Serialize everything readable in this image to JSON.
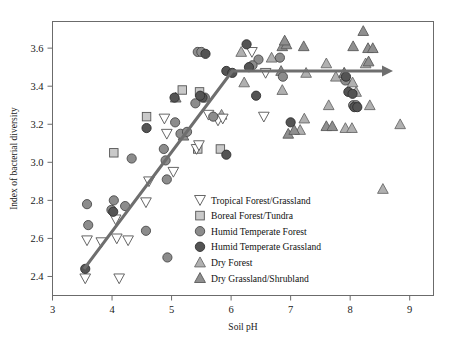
{
  "chart_data": {
    "type": "scatter",
    "title": "",
    "xlabel": "Soil pH",
    "ylabel": "Index of bacterial diversity",
    "xlim": [
      3,
      9.4
    ],
    "ylim": [
      2.3,
      3.74
    ],
    "xticks": [
      3,
      4,
      5,
      6,
      7,
      8,
      9
    ],
    "yticks": [
      2.4,
      2.6,
      2.8,
      3.0,
      3.2,
      3.4,
      3.6
    ],
    "xtick_labels": [
      "3",
      "4",
      "5",
      "6",
      "7",
      "8",
      "9"
    ],
    "ytick_labels": [
      "2.4",
      "2.6",
      "2.8",
      "3.0",
      "3.2",
      "3.4",
      "3.6"
    ],
    "grid": false,
    "legend_position": "center",
    "annotations": [
      {
        "name": "trend-arrow",
        "type": "arrow-polyline",
        "points": [
          [
            3.53,
            2.44
          ],
          [
            6.02,
            3.48
          ],
          [
            8.72,
            3.48
          ]
        ],
        "color": "#6e6e6e"
      }
    ],
    "series": [
      {
        "name": "Tropical Forest/Grassland",
        "marker": "triangle-down",
        "fill": "#ffffff",
        "edge": "#555555",
        "points": [
          [
            3.55,
            2.39
          ],
          [
            3.58,
            2.59
          ],
          [
            3.82,
            2.58
          ],
          [
            4.06,
            2.7
          ],
          [
            4.08,
            2.6
          ],
          [
            4.12,
            2.39
          ],
          [
            4.27,
            2.59
          ],
          [
            4.57,
            2.79
          ],
          [
            4.62,
            2.9
          ],
          [
            4.88,
            3.23
          ],
          [
            4.92,
            3.15
          ],
          [
            5.03,
            2.95
          ],
          [
            5.42,
            3.07
          ],
          [
            5.46,
            3.09
          ],
          [
            5.62,
            3.25
          ],
          [
            5.78,
            3.22
          ],
          [
            5.86,
            3.23
          ],
          [
            6.55,
            3.24
          ],
          [
            6.35,
            3.58
          ],
          [
            6.58,
            3.47
          ]
        ]
      },
      {
        "name": "Boreal Forest/Tundra",
        "marker": "square",
        "fill": "#c9c9c9",
        "edge": "#555555",
        "points": [
          [
            4.03,
            3.05
          ],
          [
            4.58,
            3.24
          ],
          [
            5.18,
            3.38
          ],
          [
            5.44,
            3.07
          ],
          [
            5.82,
            3.07
          ],
          [
            5.47,
            3.37
          ]
        ]
      },
      {
        "name": "Humid Temperate Forest",
        "marker": "circle",
        "fill": "#8c8c8c",
        "edge": "#4a4a4a",
        "points": [
          [
            3.58,
            2.78
          ],
          [
            3.6,
            2.67
          ],
          [
            3.99,
            2.75
          ],
          [
            4.03,
            2.8
          ],
          [
            4.22,
            2.77
          ],
          [
            4.33,
            3.02
          ],
          [
            4.57,
            2.64
          ],
          [
            4.87,
            3.07
          ],
          [
            4.9,
            3.01
          ],
          [
            4.92,
            2.91
          ],
          [
            4.93,
            2.5
          ],
          [
            5.06,
            3.21
          ],
          [
            5.15,
            3.15
          ],
          [
            5.26,
            3.16
          ],
          [
            5.4,
            3.31
          ],
          [
            5.56,
            3.34
          ],
          [
            5.44,
            3.58
          ],
          [
            5.5,
            3.58
          ],
          [
            5.7,
            3.24
          ],
          [
            6.46,
            3.54
          ],
          [
            6.36,
            3.51
          ],
          [
            6.82,
            3.55
          ],
          [
            6.87,
            3.45
          ],
          [
            7.92,
            3.43
          ],
          [
            8.05,
            3.3
          ],
          [
            8.1,
            3.3
          ]
        ]
      },
      {
        "name": "Humid Temperate Grassland",
        "marker": "circle",
        "fill": "#545454",
        "edge": "#303030",
        "points": [
          [
            3.55,
            2.44
          ],
          [
            4.02,
            2.74
          ],
          [
            4.58,
            3.18
          ],
          [
            5.05,
            3.34
          ],
          [
            5.52,
            3.34
          ],
          [
            5.57,
            3.57
          ],
          [
            5.48,
            3.35
          ],
          [
            5.92,
            3.48
          ],
          [
            6.02,
            3.47
          ],
          [
            6.26,
            3.62
          ],
          [
            6.3,
            3.5
          ],
          [
            6.42,
            3.35
          ],
          [
            5.92,
            3.04
          ],
          [
            7.0,
            3.21
          ],
          [
            7.93,
            3.45
          ],
          [
            7.97,
            3.37
          ],
          [
            8.04,
            3.36
          ],
          [
            8.07,
            3.29
          ],
          [
            8.12,
            3.29
          ]
        ]
      },
      {
        "name": "Dry Forest",
        "marker": "triangle-up",
        "fill": "#b0b0b0",
        "edge": "#6a6a6a",
        "points": [
          [
            5.84,
            3.25
          ],
          [
            6.22,
            3.42
          ],
          [
            6.17,
            3.58
          ],
          [
            6.68,
            3.55
          ],
          [
            6.86,
            3.38
          ],
          [
            7.16,
            3.17
          ],
          [
            7.23,
            3.23
          ],
          [
            7.26,
            3.47
          ],
          [
            7.6,
            3.52
          ],
          [
            7.64,
            3.3
          ],
          [
            7.76,
            3.45
          ],
          [
            7.9,
            3.47
          ],
          [
            8.04,
            3.42
          ],
          [
            8.1,
            3.37
          ],
          [
            8.26,
            3.52
          ],
          [
            8.33,
            3.3
          ],
          [
            8.84,
            3.2
          ],
          [
            8.55,
            2.86
          ],
          [
            7.92,
            3.18
          ],
          [
            8.03,
            3.18
          ]
        ]
      },
      {
        "name": "Dry Grassland/Shrubland",
        "marker": "triangle-up",
        "fill": "#8f8f8f",
        "edge": "#5a5a5a",
        "points": [
          [
            5.07,
            3.34
          ],
          [
            5.2,
            3.14
          ],
          [
            6.86,
            3.61
          ],
          [
            6.93,
            3.62
          ],
          [
            6.9,
            3.64
          ],
          [
            7.22,
            3.61
          ],
          [
            6.96,
            3.15
          ],
          [
            7.06,
            3.17
          ],
          [
            7.6,
            3.19
          ],
          [
            7.7,
            3.19
          ],
          [
            8.05,
            3.61
          ],
          [
            8.22,
            3.69
          ],
          [
            8.3,
            3.6
          ],
          [
            8.38,
            3.6
          ],
          [
            8.31,
            3.53
          ],
          [
            6.84,
            3.48
          ],
          [
            7.9,
            3.47
          ]
        ]
      }
    ],
    "legend_entries": [
      {
        "label": "Tropical Forest/Grassland",
        "marker": "triangle-down",
        "fill": "#ffffff",
        "edge": "#555555"
      },
      {
        "label": "Boreal Forest/Tundra",
        "marker": "square",
        "fill": "#c9c9c9",
        "edge": "#555555"
      },
      {
        "label": "Humid Temperate Forest",
        "marker": "circle",
        "fill": "#8c8c8c",
        "edge": "#4a4a4a"
      },
      {
        "label": "Humid Temperate Grassland",
        "marker": "circle",
        "fill": "#545454",
        "edge": "#303030"
      },
      {
        "label": "Dry Forest",
        "marker": "triangle-up",
        "fill": "#b0b0b0",
        "edge": "#6a6a6a"
      },
      {
        "label": "Dry Grassland/Shrubland",
        "marker": "triangle-up",
        "fill": "#8f8f8f",
        "edge": "#5a5a5a"
      }
    ]
  }
}
